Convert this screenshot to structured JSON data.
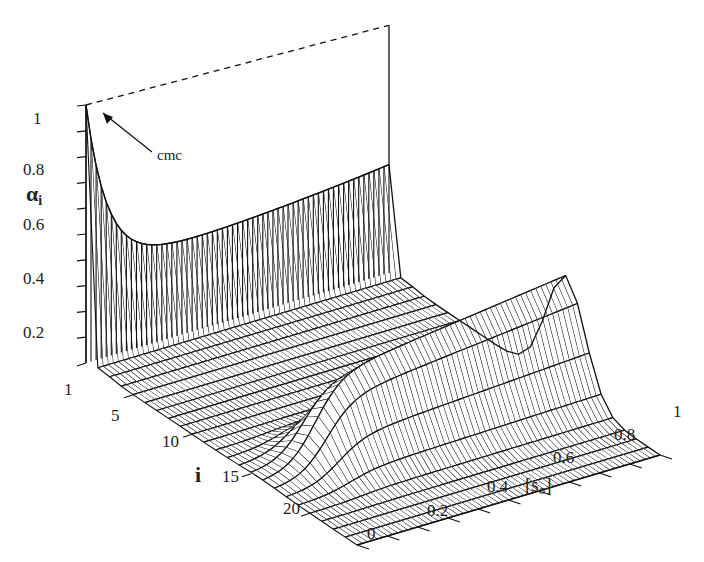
{
  "chart_data": {
    "type": "surface3d",
    "title": "",
    "zlabel": "α_i",
    "zlabel_main": "α",
    "zlabel_sub": "i",
    "xlabel": "i",
    "ylabel": "[s_o]",
    "ylabel_main": "[s",
    "ylabel_sub": "o",
    "ylabel_close": "]",
    "z_ticks": [
      "0.2",
      "0.4",
      "0.6",
      "0.8",
      "1"
    ],
    "z_tick_values": [
      0.2,
      0.4,
      0.6,
      0.8,
      1.0
    ],
    "i_ticks": [
      "1",
      "5",
      "10",
      "15",
      "20"
    ],
    "i_tick_values": [
      1,
      5,
      10,
      15,
      20
    ],
    "s_ticks": [
      "0",
      "0.2",
      "0.4",
      "0.6",
      "0.8",
      "1"
    ],
    "s_tick_values": [
      0,
      0.2,
      0.4,
      0.6,
      0.8,
      1.0
    ],
    "i_range": [
      1,
      24
    ],
    "s_range": [
      0,
      1
    ],
    "z_range": [
      0,
      1
    ],
    "annotation": {
      "text": "cmc",
      "points_to": {
        "i": 1,
        "s": 0.0,
        "z": 1.0
      }
    },
    "surface_description": "alpha_1 (i=1) falls from 1 at s_o≈0 (cmc) to ~0.35 by s_o≈0.3 then stays ~0.35–0.42 to s_o=1; a ridge centered near i≈16 rises from ~0 at s_o≈0.1 to ~0.45 at s_o≈1; other i values near 0",
    "series_samples": [
      {
        "name": "i=1",
        "s": [
          0,
          0.05,
          0.1,
          0.2,
          0.3,
          0.5,
          0.7,
          1.0
        ],
        "alpha": [
          1.0,
          0.8,
          0.6,
          0.42,
          0.36,
          0.35,
          0.37,
          0.42
        ]
      },
      {
        "name": "i=16",
        "s": [
          0,
          0.1,
          0.2,
          0.4,
          0.6,
          0.8,
          1.0
        ],
        "alpha": [
          0.0,
          0.05,
          0.22,
          0.33,
          0.38,
          0.42,
          0.45
        ]
      }
    ]
  }
}
